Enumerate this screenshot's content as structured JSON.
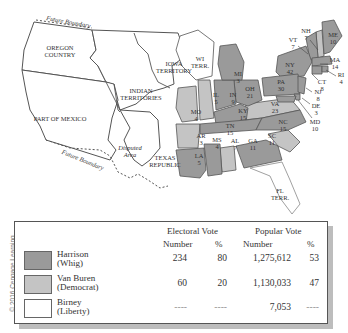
{
  "map": {
    "regions": {
      "oregon": "OREGON\nCOUNTRY",
      "oregon_l1": "OREGON",
      "oregon_l2": "COUNTRY",
      "mexico": "PART OF MEXICO",
      "indian_l1": "INDIAN",
      "indian_l2": "TERRITORIES",
      "iowa_l1": "IOWA",
      "iowa_l2": "TERRITORY",
      "wi_l1": "WI",
      "wi_l2": "TERR.",
      "texas_l1": "TEXAS",
      "texas_l2": "REPUBLIC",
      "disputed_l1": "Disputed",
      "disputed_l2": "Area",
      "fl_l1": "FL",
      "fl_l2": "TERR.",
      "future_boundary_north": "Future Boundary",
      "future_boundary_south": "Future Boundary"
    },
    "states": [
      {
        "abbr": "ME",
        "votes": "10",
        "winner": "Harrison"
      },
      {
        "abbr": "NH",
        "votes": "7",
        "winner": "Van Buren"
      },
      {
        "abbr": "VT",
        "votes": "7",
        "winner": "Harrison"
      },
      {
        "abbr": "MA",
        "votes": "14",
        "winner": "Harrison"
      },
      {
        "abbr": "RI",
        "votes": "4",
        "winner": "Harrison"
      },
      {
        "abbr": "CT",
        "votes": "8",
        "winner": "Harrison"
      },
      {
        "abbr": "NY",
        "votes": "42",
        "winner": "Harrison"
      },
      {
        "abbr": "NJ",
        "votes": "8",
        "winner": "Harrison"
      },
      {
        "abbr": "PA",
        "votes": "30",
        "winner": "Harrison"
      },
      {
        "abbr": "DE",
        "votes": "3",
        "winner": "Harrison"
      },
      {
        "abbr": "MD",
        "votes": "10",
        "winner": "Harrison"
      },
      {
        "abbr": "VA",
        "votes": "23",
        "winner": "Van Buren"
      },
      {
        "abbr": "NC",
        "votes": "15",
        "winner": "Harrison"
      },
      {
        "abbr": "SC",
        "votes": "11",
        "winner": "Van Buren"
      },
      {
        "abbr": "GA",
        "votes": "11",
        "winner": "Harrison"
      },
      {
        "abbr": "AL",
        "votes": "7",
        "winner": "Van Buren"
      },
      {
        "abbr": "MS",
        "votes": "4",
        "winner": "Harrison"
      },
      {
        "abbr": "LA",
        "votes": "5",
        "winner": "Harrison"
      },
      {
        "abbr": "TN",
        "votes": "15",
        "winner": "Harrison"
      },
      {
        "abbr": "KY",
        "votes": "15",
        "winner": "Harrison"
      },
      {
        "abbr": "OH",
        "votes": "21",
        "winner": "Harrison"
      },
      {
        "abbr": "IN",
        "votes": "9",
        "winner": "Harrison"
      },
      {
        "abbr": "IL",
        "votes": "5",
        "winner": "Van Buren"
      },
      {
        "abbr": "MI",
        "votes": "3",
        "winner": "Harrison"
      },
      {
        "abbr": "MO",
        "votes": "4",
        "winner": "Van Buren"
      },
      {
        "abbr": "AR",
        "votes": "3",
        "winner": "Van Buren"
      }
    ],
    "colors": {
      "harrison": "#9a9a9a",
      "van_buren": "#c4c4c4",
      "birney": "#ffffff",
      "territory": "#ffffff",
      "border": "#555555"
    }
  },
  "legend": {
    "headers": {
      "electoral": "Electoral Vote",
      "popular": "Popular Vote",
      "number": "Number",
      "percent": "%"
    },
    "rows": [
      {
        "name": "Harrison",
        "party": "(Whig)",
        "ev_number": "234",
        "ev_pct": "80",
        "pv_number": "1,275,612",
        "pv_pct": "53",
        "color": "#9a9a9a"
      },
      {
        "name": "Van Buren",
        "party": "(Democrat)",
        "ev_number": "60",
        "ev_pct": "20",
        "pv_number": "1,130,033",
        "pv_pct": "47",
        "color": "#c4c4c4"
      },
      {
        "name": "Birney",
        "party": "(Liberty)",
        "ev_number": "----",
        "ev_pct": "----",
        "pv_number": "7,053",
        "pv_pct": "----",
        "color": "#ffffff"
      }
    ]
  },
  "credit": "© 2016 Cengage Learning"
}
